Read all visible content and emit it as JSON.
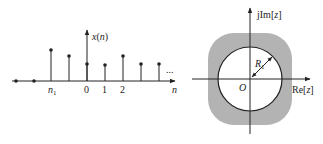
{
  "left_figure": {
    "y_axis_label": "x(n)",
    "x_axis_label": "n",
    "tick_labels": [
      "n",
      "0",
      "1",
      "2"
    ],
    "n1_sub": "1",
    "ellipsis": "...",
    "stems": [
      {
        "x": 16,
        "top": 81
      },
      {
        "x": 34,
        "top": 81
      },
      {
        "x": 51,
        "top": 50
      },
      {
        "x": 69,
        "top": 56
      },
      {
        "x": 87,
        "top": 64
      },
      {
        "x": 105,
        "top": 65
      },
      {
        "x": 123,
        "top": 56
      },
      {
        "x": 141,
        "top": 64
      },
      {
        "x": 159,
        "top": 64
      }
    ]
  },
  "right_figure": {
    "im_label": "jIm[z]",
    "re_label": "Re[z]",
    "origin_label": "O",
    "radius_label": "R",
    "radius_sub": "1",
    "region_color": "#b3b3b3"
  }
}
